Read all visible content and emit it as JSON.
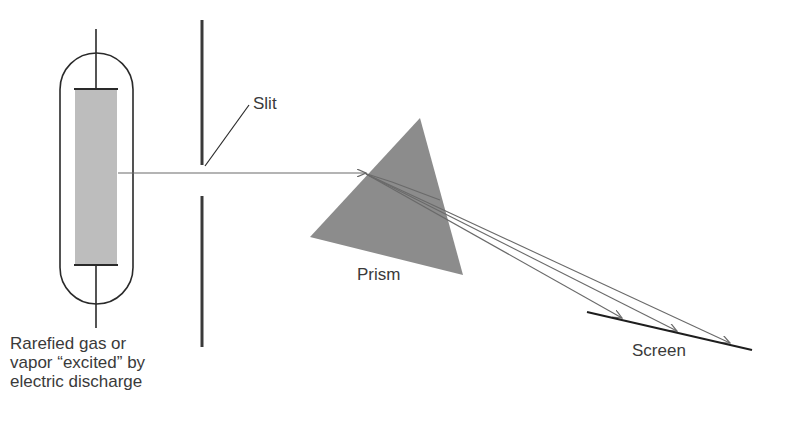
{
  "diagram": {
    "labels": {
      "slit": "Slit",
      "prism": "Prism",
      "screen": "Screen",
      "source_line1": "Rarefied gas or",
      "source_line2": "vapor “excited” by",
      "source_line3": "electric discharge"
    },
    "colors": {
      "background": "#ffffff",
      "line": "#2a2a2a",
      "ray": "#6a6a6a",
      "prism_fill": "#8c8c8c",
      "tube_fill": "#bdbdbd",
      "text": "#3a3a3a"
    },
    "components": [
      {
        "id": "discharge-tube",
        "label": "Rarefied gas or vapor “excited” by electric discharge"
      },
      {
        "id": "slit",
        "label": "Slit"
      },
      {
        "id": "prism",
        "label": "Prism"
      },
      {
        "id": "screen",
        "label": "Screen"
      }
    ],
    "dispersed_rays": 3
  }
}
